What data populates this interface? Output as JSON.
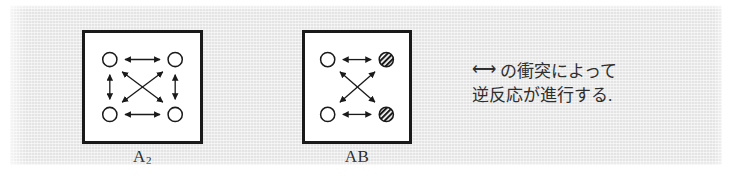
{
  "figure": {
    "background_color": "#e4e4e4",
    "panel_background": "#ffffff",
    "ink_color": "#1a1a1a"
  },
  "panels": [
    {
      "id": "A2",
      "caption_main": "A",
      "caption_sub": "2",
      "nodes": [
        {
          "name": "top-left",
          "fill": "open",
          "x": 26,
          "y": 28
        },
        {
          "name": "top-right",
          "fill": "open",
          "x": 95,
          "y": 28
        },
        {
          "name": "bottom-left",
          "fill": "open",
          "x": 26,
          "y": 86
        },
        {
          "name": "bottom-right",
          "fill": "open",
          "x": 95,
          "y": 86
        }
      ],
      "arrows": [
        {
          "name": "top-edge",
          "from": "top-left",
          "to": "top-right",
          "style": "double-headed"
        },
        {
          "name": "bottom-edge",
          "from": "bottom-left",
          "to": "bottom-right",
          "style": "double-headed"
        },
        {
          "name": "left-edge",
          "from": "top-left",
          "to": "bottom-left",
          "style": "double-headed"
        },
        {
          "name": "right-edge",
          "from": "top-right",
          "to": "bottom-right",
          "style": "double-headed"
        },
        {
          "name": "diagonal-tl-br",
          "from": "top-left",
          "to": "bottom-right",
          "style": "double-headed"
        },
        {
          "name": "diagonal-tr-bl",
          "from": "top-right",
          "to": "bottom-left",
          "style": "double-headed"
        }
      ]
    },
    {
      "id": "AB",
      "caption_main": "AB",
      "caption_sub": "",
      "nodes": [
        {
          "name": "top-left",
          "fill": "open",
          "x": 24,
          "y": 28
        },
        {
          "name": "top-right",
          "fill": "hatched",
          "x": 86,
          "y": 28
        },
        {
          "name": "bottom-left",
          "fill": "open",
          "x": 24,
          "y": 86
        },
        {
          "name": "bottom-right",
          "fill": "hatched",
          "x": 86,
          "y": 86
        }
      ],
      "arrows": [
        {
          "name": "top-edge",
          "from": "top-left",
          "to": "top-right",
          "style": "double-headed"
        },
        {
          "name": "bottom-edge",
          "from": "bottom-left",
          "to": "bottom-right",
          "style": "double-headed"
        },
        {
          "name": "diagonal-tl-br",
          "from": "top-left",
          "to": "bottom-right",
          "style": "double-headed"
        },
        {
          "name": "diagonal-tr-bl",
          "from": "top-right",
          "to": "bottom-left",
          "style": "double-headed"
        }
      ]
    }
  ],
  "annotation": {
    "line1_arrow": "⟷",
    "line1_text": "の衝突によって",
    "line2_text": "逆反応が進行する."
  }
}
